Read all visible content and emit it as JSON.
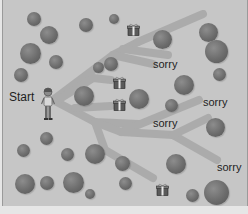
{
  "game": {
    "type": "maze-illustration",
    "start_label": "Start",
    "colors": {
      "background": "#c6c6c6",
      "path": "#a8a8a8",
      "tree": "#6c6c6c",
      "text": "#1e1e1e"
    }
  },
  "labels": [
    {
      "id": "sorry-1",
      "text": "sorry",
      "x": 150,
      "y": 59
    },
    {
      "id": "sorry-2",
      "text": "sorry",
      "x": 200,
      "y": 97
    },
    {
      "id": "sorry-3",
      "text": "sorry",
      "x": 150,
      "y": 118
    },
    {
      "id": "sorry-4",
      "text": "sorry",
      "x": 214,
      "y": 162
    }
  ],
  "gifts": [
    {
      "id": "gift-1",
      "x": 124,
      "y": 23
    },
    {
      "id": "gift-2",
      "x": 110,
      "y": 76
    },
    {
      "id": "gift-3",
      "x": 110,
      "y": 98
    },
    {
      "id": "gift-4",
      "x": 153,
      "y": 183
    }
  ],
  "trees": [
    {
      "x": 24,
      "y": 12,
      "s": 14
    },
    {
      "x": 37,
      "y": 26,
      "s": 18
    },
    {
      "x": 76,
      "y": 18,
      "s": 14
    },
    {
      "x": 106,
      "y": 14,
      "s": 10
    },
    {
      "x": 17,
      "y": 43,
      "s": 21
    },
    {
      "x": 46,
      "y": 55,
      "s": 14
    },
    {
      "x": 11,
      "y": 68,
      "s": 14
    },
    {
      "x": 90,
      "y": 62,
      "s": 11
    },
    {
      "x": 101,
      "y": 57,
      "s": 14
    },
    {
      "x": 71,
      "y": 86,
      "s": 20
    },
    {
      "x": 150,
      "y": 30,
      "s": 19
    },
    {
      "x": 196,
      "y": 23,
      "s": 19
    },
    {
      "x": 202,
      "y": 40,
      "s": 23
    },
    {
      "x": 210,
      "y": 68,
      "s": 13
    },
    {
      "x": 171,
      "y": 75,
      "s": 20
    },
    {
      "x": 126,
      "y": 89,
      "s": 20
    },
    {
      "x": 162,
      "y": 99,
      "s": 13
    },
    {
      "x": 203,
      "y": 118,
      "s": 19
    },
    {
      "x": 37,
      "y": 132,
      "s": 13
    },
    {
      "x": 14,
      "y": 144,
      "s": 13
    },
    {
      "x": 58,
      "y": 148,
      "s": 13
    },
    {
      "x": 82,
      "y": 144,
      "s": 20
    },
    {
      "x": 112,
      "y": 156,
      "s": 15
    },
    {
      "x": 163,
      "y": 154,
      "s": 20
    },
    {
      "x": 12,
      "y": 174,
      "s": 20
    },
    {
      "x": 37,
      "y": 176,
      "s": 14
    },
    {
      "x": 60,
      "y": 172,
      "s": 21
    },
    {
      "x": 82,
      "y": 189,
      "s": 10
    },
    {
      "x": 116,
      "y": 177,
      "s": 13
    },
    {
      "x": 183,
      "y": 189,
      "s": 13
    },
    {
      "x": 201,
      "y": 180,
      "s": 25
    }
  ],
  "character": {
    "name": "child",
    "x": 38,
    "y": 88
  }
}
